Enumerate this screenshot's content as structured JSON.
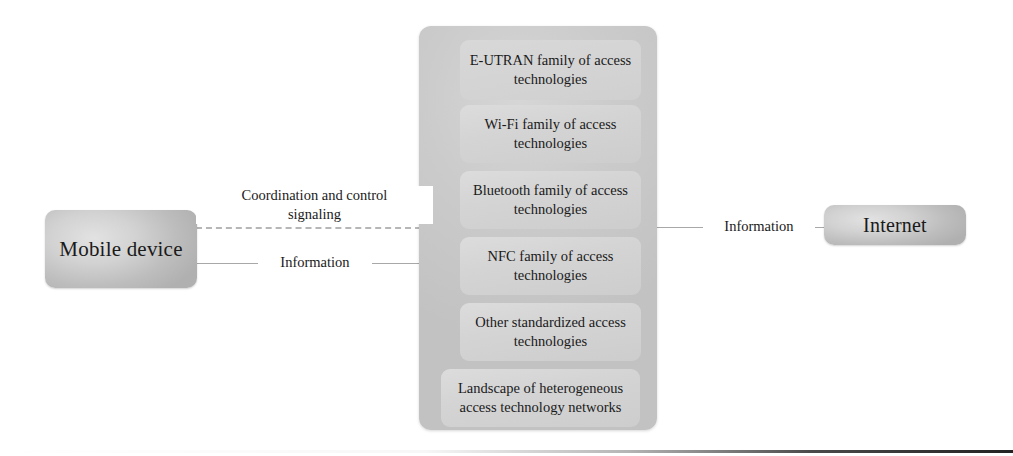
{
  "diagram": {
    "colors": {
      "node_fill": "#d2d2d2",
      "container_fill": "#c8c8c8",
      "inner_box_fill": "#d6d6d6",
      "line": "#a8a8a8",
      "text": "#1a1a1a"
    },
    "endpoints": {
      "mobile_device": "Mobile device",
      "internet": "Internet"
    },
    "container": {
      "items": [
        {
          "label": "E-UTRAN family of access technologies"
        },
        {
          "label": "Wi-Fi family of access technologies"
        },
        {
          "label": "Bluetooth family of access technologies"
        },
        {
          "label": "NFC family of access technologies"
        },
        {
          "label": "Other standardized access technologies"
        },
        {
          "label": "Landscape of heterogeneous access technology networks"
        }
      ]
    },
    "edges": {
      "coordination": "Coordination and control\nsignaling",
      "information_left": "Information",
      "information_right": "Information"
    }
  }
}
